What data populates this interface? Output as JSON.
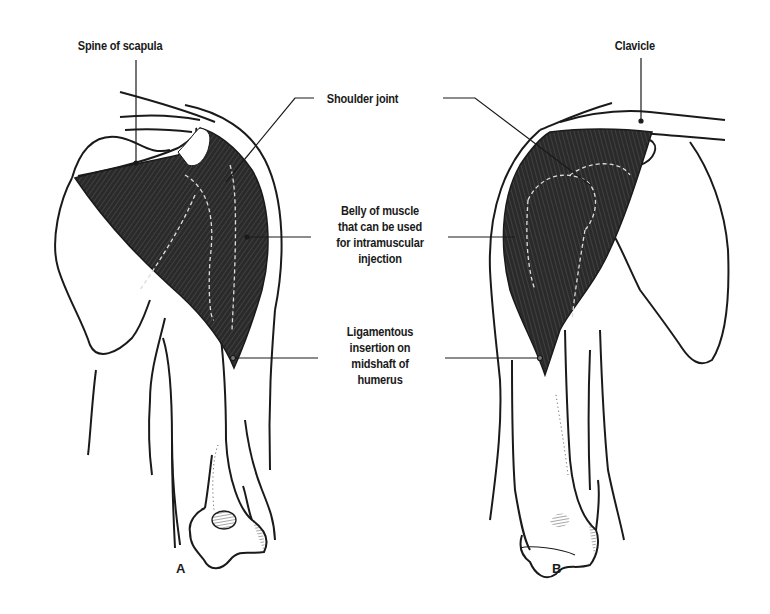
{
  "figure": {
    "type": "anatomical-illustration",
    "colors": {
      "ink": "#1a1a1a",
      "muscle_fill": "#2b2b2b",
      "muscle_shade": "#555555",
      "background": "#ffffff"
    },
    "labels": {
      "spine_of_scapula": "Spine of scapula",
      "clavicle": "Clavicle",
      "shoulder_joint": "Shoulder joint",
      "belly_line1": "Belly of muscle",
      "belly_line2": "that can be used",
      "belly_line3": "for intramuscular",
      "belly_line4": "injection",
      "insertion_line1": "Ligamentous",
      "insertion_line2": "insertion on",
      "insertion_line3": "midshaft of",
      "insertion_line4": "humerus"
    },
    "views": [
      {
        "id": "A",
        "label": "A",
        "description": "posterior view"
      },
      {
        "id": "B",
        "label": "B",
        "description": "anterior view"
      }
    ]
  }
}
